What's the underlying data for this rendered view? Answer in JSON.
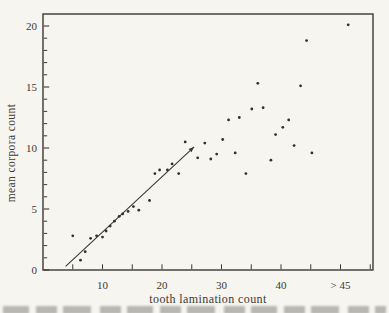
{
  "chart_data": {
    "type": "scatter",
    "title": "",
    "xlabel": "tooth lamination count",
    "ylabel": "mean corpora count",
    "xlim": [
      0,
      55.5
    ],
    "ylim": [
      0,
      21
    ],
    "grid": false,
    "frame": "full-box",
    "x_axis": {
      "tick_values": [
        5,
        10,
        15,
        20,
        25,
        30,
        35,
        40,
        45,
        50,
        55
      ],
      "major_ticks": [
        {
          "value": 10,
          "label": "10"
        },
        {
          "value": 20,
          "label": "20"
        },
        {
          "value": 30,
          "label": "30"
        },
        {
          "value": 40,
          "label": "40"
        },
        {
          "value": 50,
          "label": "> 45"
        }
      ]
    },
    "y_axis": {
      "minor_tick_step": 1,
      "major_ticks": [
        {
          "value": 0,
          "label": "0"
        },
        {
          "value": 5,
          "label": "5"
        },
        {
          "value": 10,
          "label": "10"
        },
        {
          "value": 15,
          "label": "15"
        },
        {
          "value": 20,
          "label": "20"
        }
      ]
    },
    "points": [
      [
        5.0,
        2.8
      ],
      [
        6.3,
        0.8
      ],
      [
        7.1,
        1.5
      ],
      [
        8.0,
        2.6
      ],
      [
        9.0,
        2.8
      ],
      [
        10.0,
        2.7
      ],
      [
        10.6,
        3.2
      ],
      [
        11.3,
        3.6
      ],
      [
        12.0,
        4.0
      ],
      [
        12.8,
        4.4
      ],
      [
        13.4,
        4.6
      ],
      [
        14.3,
        4.8
      ],
      [
        15.2,
        5.2
      ],
      [
        16.1,
        4.9
      ],
      [
        17.9,
        5.7
      ],
      [
        18.8,
        7.9
      ],
      [
        19.6,
        8.2
      ],
      [
        20.9,
        8.2
      ],
      [
        21.7,
        8.7
      ],
      [
        22.8,
        7.9
      ],
      [
        23.9,
        10.5
      ],
      [
        26.0,
        9.2
      ],
      [
        27.2,
        10.4
      ],
      [
        28.2,
        9.1
      ],
      [
        29.2,
        9.5
      ],
      [
        30.2,
        10.7
      ],
      [
        31.2,
        12.3
      ],
      [
        32.3,
        9.6
      ],
      [
        33.0,
        12.5
      ],
      [
        34.1,
        7.9
      ],
      [
        35.1,
        13.2
      ],
      [
        36.1,
        15.3
      ],
      [
        37.0,
        13.3
      ],
      [
        38.3,
        9.0
      ],
      [
        39.1,
        11.1
      ],
      [
        40.3,
        11.7
      ],
      [
        41.3,
        12.3
      ],
      [
        42.2,
        10.2
      ],
      [
        43.3,
        15.1
      ],
      [
        44.3,
        18.8
      ],
      [
        45.2,
        9.6
      ],
      [
        51.3,
        20.1
      ]
    ],
    "fit_line": {
      "x1": 3.8,
      "y1": 0.3,
      "x2": 25.4,
      "y2": 10.1,
      "arrowhead_at_end": true
    },
    "colors": {
      "ink": "#3b3935",
      "point": "#31302c",
      "paper": "#f6f5f0"
    }
  }
}
